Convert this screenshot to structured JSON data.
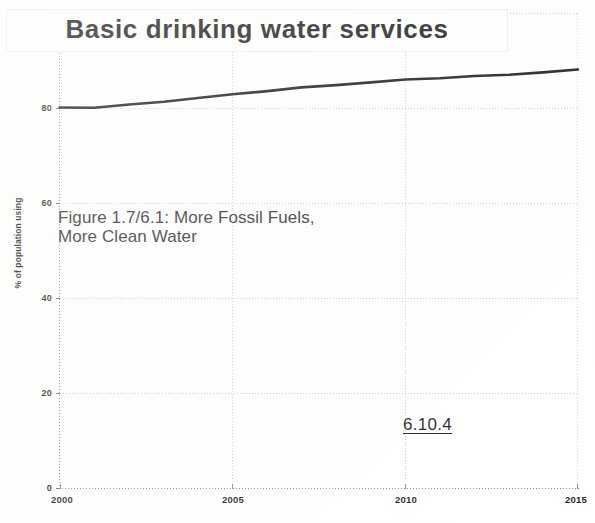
{
  "chart_data": {
    "type": "line",
    "title": "Basic drinking water services",
    "xlabel": "",
    "ylabel": "% of population using",
    "xlim": [
      2000,
      2015
    ],
    "ylim": [
      0,
      100
    ],
    "grid": true,
    "legend": "none",
    "xticks": [
      "2000",
      "2005",
      "2010",
      "2015"
    ],
    "yticks": [
      "0",
      "20",
      "40",
      "60",
      "80",
      "100"
    ],
    "x": [
      2000,
      2001,
      2002,
      2003,
      2004,
      2005,
      2006,
      2007,
      2008,
      2009,
      2010,
      2011,
      2012,
      2013,
      2014,
      2015
    ],
    "series": [
      {
        "name": "Basic drinking water services",
        "color": "#111111",
        "values": [
          80.0,
          80.1,
          80.7,
          81.4,
          82.1,
          82.8,
          83.6,
          84.3,
          84.9,
          85.4,
          85.9,
          86.3,
          86.7,
          87.1,
          87.5,
          88.0
        ]
      }
    ],
    "annotations": [
      {
        "name": "figure-caption",
        "text": "Figure 1.7/6.1: More Fossil Fuels,\nMore Clean Water"
      },
      {
        "name": "section-reference",
        "text": "6.10.4"
      }
    ]
  },
  "overlay": {
    "caption": "Figure 1.7/6.1: More Fossil Fuels,\nMore Clean Water",
    "section_ref": "6.10.4"
  }
}
